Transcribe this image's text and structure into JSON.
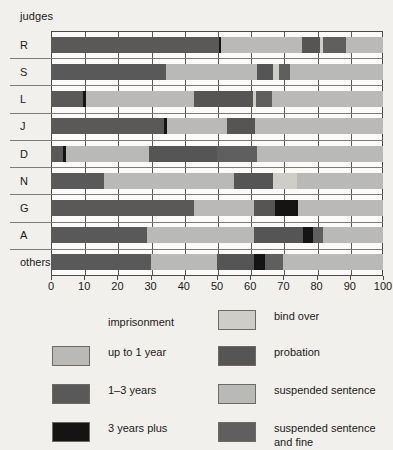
{
  "chart_data": {
    "type": "bar",
    "orientation": "horizontal",
    "stacked": true,
    "title": "",
    "xlabel": "",
    "ylabel": "judges",
    "xlim": [
      0,
      100
    ],
    "grid": true,
    "legend_position": "bottom",
    "xticks": [
      0,
      10,
      20,
      30,
      40,
      50,
      60,
      70,
      80,
      90,
      100
    ],
    "xticklabels": [
      "0",
      "10",
      "20",
      "30",
      "40",
      "50",
      "60",
      "70",
      "80",
      "90",
      "100"
    ],
    "categories": [
      "R",
      "S",
      "L",
      "J",
      "D",
      "N",
      "G",
      "A",
      "others"
    ],
    "series": [
      {
        "name": "up to 1 year",
        "key": "up_to_1_year",
        "color": "#b9b9b7",
        "values": [
          0,
          0,
          0,
          0,
          0,
          0,
          0,
          0,
          0
        ]
      },
      {
        "name": "1–3 years",
        "key": "one_to_three_years",
        "color": "#595959",
        "values": [
          50.5,
          34.5,
          9.5,
          34.0,
          3.5,
          16.0,
          43.0,
          29.0,
          30.0
        ]
      },
      {
        "name": "3 years plus",
        "key": "three_years_plus",
        "color": "#141414",
        "values": [
          0.8,
          0.0,
          1.0,
          1.0,
          1.0,
          0.0,
          0.0,
          0.0,
          0.0
        ]
      },
      {
        "name": "bind over",
        "key": "bind_over",
        "color": "#cfcdc8",
        "values": [
          0,
          0,
          0,
          0,
          0,
          0,
          0,
          0,
          0
        ]
      },
      {
        "name": "probation",
        "key": "probation",
        "color": "#555555",
        "values": [
          0,
          0,
          0,
          0,
          0,
          0,
          0,
          0,
          0
        ]
      },
      {
        "name": "suspended sentence",
        "key": "suspended_sentence",
        "color": "#b9b9b7",
        "values": [
          0,
          0,
          0,
          0,
          0,
          0,
          0,
          0,
          0
        ]
      },
      {
        "name": "suspended sentence\nand fine",
        "key": "suspended_and_fine",
        "color": "#5f5f5f",
        "values": [
          0,
          0,
          0,
          0,
          0,
          0,
          0,
          0,
          0
        ]
      }
    ],
    "bars": [
      {
        "category": "R",
        "segments": [
          {
            "series": "1–3 years",
            "start": 0,
            "end": 50.5
          },
          {
            "series": "3 years plus",
            "start": 50.5,
            "end": 51.3
          },
          {
            "series": "up to 1 year",
            "start": 51.3,
            "end": 75.5
          },
          {
            "series": "probation",
            "start": 75.5,
            "end": 81.0
          },
          {
            "series": "bind over",
            "start": 81.0,
            "end": 82.0
          },
          {
            "series": "suspended sentence and fine",
            "start": 82.0,
            "end": 89.0
          },
          {
            "series": "suspended sentence",
            "start": 89.0,
            "end": 100
          }
        ]
      },
      {
        "category": "S",
        "segments": [
          {
            "series": "1–3 years",
            "start": 0,
            "end": 34.5
          },
          {
            "series": "up to 1 year",
            "start": 34.5,
            "end": 62.0
          },
          {
            "series": "probation",
            "start": 62.0,
            "end": 67.0
          },
          {
            "series": "bind over",
            "start": 67.0,
            "end": 68.8
          },
          {
            "series": "suspended sentence and fine",
            "start": 68.8,
            "end": 72.0
          },
          {
            "series": "suspended sentence",
            "start": 72.0,
            "end": 100
          }
        ]
      },
      {
        "category": "L",
        "segments": [
          {
            "series": "1–3 years",
            "start": 0,
            "end": 9.5
          },
          {
            "series": "3 years plus",
            "start": 9.5,
            "end": 10.5
          },
          {
            "series": "up to 1 year",
            "start": 10.5,
            "end": 43.0
          },
          {
            "series": "probation",
            "start": 43.0,
            "end": 61.0
          },
          {
            "series": "bind over",
            "start": 61.0,
            "end": 61.8
          },
          {
            "series": "suspended sentence and fine",
            "start": 61.8,
            "end": 66.5
          },
          {
            "series": "suspended sentence",
            "start": 66.5,
            "end": 100
          }
        ]
      },
      {
        "category": "J",
        "segments": [
          {
            "series": "1–3 years",
            "start": 0,
            "end": 34.0
          },
          {
            "series": "3 years plus",
            "start": 34.0,
            "end": 35.0
          },
          {
            "series": "up to 1 year",
            "start": 35.0,
            "end": 53.0
          },
          {
            "series": "probation",
            "start": 53.0,
            "end": 61.5
          },
          {
            "series": "suspended sentence",
            "start": 61.5,
            "end": 100
          }
        ]
      },
      {
        "category": "D",
        "segments": [
          {
            "series": "1–3 years",
            "start": 0,
            "end": 3.5
          },
          {
            "series": "3 years plus",
            "start": 3.5,
            "end": 4.5
          },
          {
            "series": "up to 1 year",
            "start": 4.5,
            "end": 29.5
          },
          {
            "series": "probation",
            "start": 29.5,
            "end": 50.0
          },
          {
            "series": "suspended sentence and fine",
            "start": 50.0,
            "end": 62.0
          },
          {
            "series": "suspended sentence",
            "start": 62.0,
            "end": 100
          }
        ]
      },
      {
        "category": "N",
        "segments": [
          {
            "series": "1–3 years",
            "start": 0,
            "end": 16.0
          },
          {
            "series": "up to 1 year",
            "start": 16.0,
            "end": 55.0
          },
          {
            "series": "probation",
            "start": 55.0,
            "end": 67.0
          },
          {
            "series": "bind over",
            "start": 67.0,
            "end": 74.0
          },
          {
            "series": "suspended sentence",
            "start": 74.0,
            "end": 100
          }
        ]
      },
      {
        "category": "G",
        "segments": [
          {
            "series": "1–3 years",
            "start": 0,
            "end": 43.0
          },
          {
            "series": "up to 1 year",
            "start": 43.0,
            "end": 61.0
          },
          {
            "series": "probation",
            "start": 61.0,
            "end": 67.5
          },
          {
            "series": "3 years plus",
            "start": 67.5,
            "end": 74.5
          },
          {
            "series": "suspended sentence",
            "start": 74.5,
            "end": 100
          }
        ]
      },
      {
        "category": "A",
        "segments": [
          {
            "series": "1–3 years",
            "start": 0,
            "end": 29.0
          },
          {
            "series": "up to 1 year",
            "start": 29.0,
            "end": 61.0
          },
          {
            "series": "probation",
            "start": 61.0,
            "end": 76.0
          },
          {
            "series": "3 years plus",
            "start": 76.0,
            "end": 79.0
          },
          {
            "series": "suspended sentence and fine",
            "start": 79.0,
            "end": 82.0
          },
          {
            "series": "suspended sentence",
            "start": 82.0,
            "end": 100
          }
        ]
      },
      {
        "category": "others",
        "segments": [
          {
            "series": "1–3 years",
            "start": 0,
            "end": 30.0
          },
          {
            "series": "up to 1 year",
            "start": 30.0,
            "end": 50.0
          },
          {
            "series": "probation",
            "start": 50.0,
            "end": 61.0
          },
          {
            "series": "3 years plus",
            "start": 61.0,
            "end": 64.5
          },
          {
            "series": "suspended sentence and fine",
            "start": 64.5,
            "end": 70.0
          },
          {
            "series": "suspended sentence",
            "start": 70.0,
            "end": 100
          }
        ]
      }
    ]
  },
  "legend": {
    "heading": "imprisonment",
    "items": [
      {
        "label": "up to 1 year",
        "color": "#b9b9b7",
        "col": 0,
        "row": 1
      },
      {
        "label": "1–3 years",
        "color": "#595959",
        "col": 0,
        "row": 2
      },
      {
        "label": "3 years plus",
        "color": "#141414",
        "col": 0,
        "row": 3
      },
      {
        "label": "bind over",
        "color": "#cfcdc8",
        "col": 1,
        "row": 0
      },
      {
        "label": "probation",
        "color": "#555555",
        "col": 1,
        "row": 1
      },
      {
        "label": "suspended sentence",
        "color": "#b9b9b7",
        "col": 1,
        "row": 2
      },
      {
        "label": "suspended sentence\nand fine",
        "color": "#5f5f5f",
        "col": 1,
        "row": 3
      }
    ]
  },
  "axis": {
    "ylabel": "judges"
  }
}
